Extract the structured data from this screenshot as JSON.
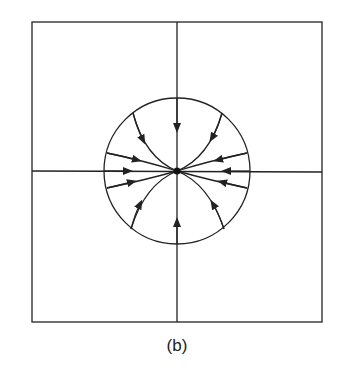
{
  "figure": {
    "caption": "(b)",
    "colors": {
      "stroke": "#222222",
      "background": "#ffffff"
    },
    "frame": {
      "x1": 32,
      "y1": 22,
      "x2": 322,
      "y2": 322
    },
    "center": {
      "x": 177,
      "y": 171
    },
    "circle_radius": 73,
    "node": "stable-node-at-origin",
    "trajectory_count": 10
  }
}
